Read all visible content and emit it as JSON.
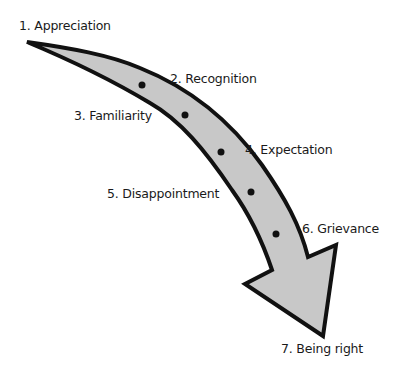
{
  "diagram": {
    "type": "curved-arrow-stages",
    "colors": {
      "arrow_fill": "#c8c8c8",
      "arrow_stroke": "#111111",
      "dot": "#111111",
      "text": "#1a1a1a",
      "background": "#ffffff"
    },
    "stages": [
      {
        "label": "1. Appreciation"
      },
      {
        "label": "2. Recognition"
      },
      {
        "label": "3. Familiarity"
      },
      {
        "label": "4. Expectation"
      },
      {
        "label": "5. Disappointment"
      },
      {
        "label": "6. Grievance"
      },
      {
        "label": "7. Being right"
      }
    ]
  }
}
